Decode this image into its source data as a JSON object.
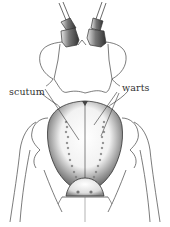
{
  "figure": {
    "labels": [
      {
        "id": "scutum",
        "text": "scutum"
      },
      {
        "id": "warts",
        "text": "warts"
      }
    ]
  },
  "colors": {
    "ink": "#333333",
    "shade_dark": "#555555",
    "shade_mid": "#999999",
    "background": "#ffffff"
  }
}
